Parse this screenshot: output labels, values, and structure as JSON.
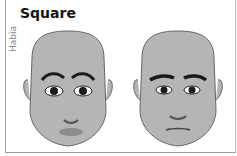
{
  "title": "Square",
  "credit": "Habia",
  "faces": [
    {
      "label": "female-square-face"
    },
    {
      "label": "male-square-face"
    }
  ],
  "colors": {
    "skin": "#b5b5b5",
    "outline": "#666666",
    "lips": "#8c8c8c",
    "dark": "#1a1a1a"
  }
}
